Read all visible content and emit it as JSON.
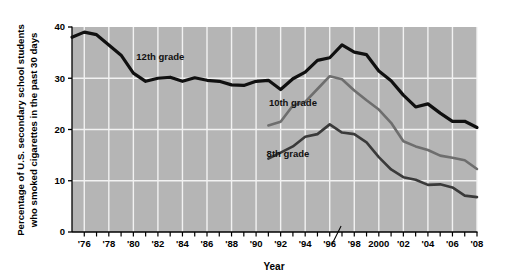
{
  "chart_data": {
    "type": "line",
    "title": "",
    "xlabel": "Year",
    "ylabel": "Percentage of U.S. secondary school students who smoked cigarettes in the past 30 days",
    "ylabel_line1": "Percentage of U.S. secondary school students",
    "ylabel_line2": "who smoked cigarettes in the past 30 days",
    "xlim": [
      1975,
      2008
    ],
    "ylim": [
      0,
      40
    ],
    "y_ticks": [
      0,
      10,
      20,
      30,
      40
    ],
    "y_tick_labels": [
      "0",
      "10",
      "20",
      "30",
      "40"
    ],
    "x_ticks": [
      1976,
      1977,
      1978,
      1979,
      1980,
      1981,
      1982,
      1983,
      1984,
      1985,
      1986,
      1987,
      1988,
      1989,
      1990,
      1991,
      1992,
      1993,
      1994,
      1995,
      1996,
      1997,
      1998,
      1999,
      2000,
      2001,
      2002,
      2003,
      2004,
      2005,
      2006,
      2007,
      2008
    ],
    "x_tick_labels": [
      "'76",
      "'78",
      "'80",
      "'82",
      "'84",
      "'86",
      "'88",
      "'90",
      "'92",
      "'94",
      "'96",
      "'98",
      "2000",
      "'02",
      "'04",
      "'06",
      "'08"
    ],
    "x_tick_label_years": [
      1976,
      1978,
      1980,
      1982,
      1984,
      1986,
      1988,
      1990,
      1992,
      1994,
      1996,
      1998,
      2000,
      2002,
      2004,
      2006,
      2008
    ],
    "grid": "white gridlines on gray plot background",
    "grid_x_years": [
      1976,
      1978,
      1980,
      1982,
      1984,
      1986,
      1988,
      1990,
      1992,
      1994,
      1996,
      1998,
      2000,
      2002,
      2004,
      2006,
      2008
    ],
    "grid_y_values": [
      10,
      20,
      30
    ],
    "legend_position": "inline annotations on plot",
    "plot_background_color": "#b5b5b5",
    "gridline_color": "#f2f2f2",
    "series": [
      {
        "name": "12th grade",
        "label": "12th grade",
        "color": "#101010",
        "x": [
          1975,
          1976,
          1977,
          1978,
          1979,
          1980,
          1981,
          1982,
          1983,
          1984,
          1985,
          1986,
          1987,
          1988,
          1989,
          1990,
          1991,
          1992,
          1993,
          1994,
          1995,
          1996,
          1997,
          1998,
          1999,
          2000,
          2001,
          2002,
          2003,
          2004,
          2005,
          2006,
          2007,
          2008
        ],
        "values": [
          38.0,
          39.0,
          38.5,
          36.5,
          34.5,
          31.0,
          29.4,
          30.0,
          30.2,
          29.4,
          30.1,
          29.6,
          29.4,
          28.7,
          28.6,
          29.4,
          29.6,
          27.8,
          29.9,
          31.2,
          33.5,
          34.0,
          36.5,
          35.1,
          34.6,
          31.4,
          29.5,
          26.7,
          24.4,
          25.0,
          23.2,
          21.6,
          21.6,
          20.4
        ],
        "peak_value": 37,
        "peak_year": 1997,
        "start_value": 38,
        "end_value": 21
      },
      {
        "name": "10th grade",
        "label": "10th grade",
        "color": "#6e6e6e",
        "x": [
          1991,
          1992,
          1993,
          1994,
          1995,
          1996,
          1997,
          1998,
          1999,
          2000,
          2001,
          2002,
          2003,
          2004,
          2005,
          2006,
          2007,
          2008
        ],
        "values": [
          20.8,
          21.5,
          24.7,
          25.4,
          27.9,
          30.4,
          29.8,
          27.6,
          25.7,
          23.9,
          21.3,
          17.7,
          16.7,
          16.0,
          14.9,
          14.5,
          14.0,
          12.3
        ],
        "peak_value": 30,
        "peak_year": 1996,
        "start_value": 21,
        "end_value": 13
      },
      {
        "name": "8th grade",
        "label": "8th grade",
        "color": "#3a3a3a",
        "x": [
          1991,
          1992,
          1993,
          1994,
          1995,
          1996,
          1997,
          1998,
          1999,
          2000,
          2001,
          2002,
          2003,
          2004,
          2005,
          2006,
          2007,
          2008
        ],
        "values": [
          14.3,
          15.5,
          16.7,
          18.6,
          19.1,
          21.0,
          19.4,
          19.1,
          17.5,
          14.6,
          12.2,
          10.7,
          10.2,
          9.2,
          9.3,
          8.7,
          7.1,
          6.8
        ],
        "peak_value": 21,
        "peak_year": 1996,
        "start_value": 15,
        "end_value": 7
      }
    ],
    "annotations": [
      {
        "text": "12th grade",
        "x_year": 1982.2,
        "y_value": 33.6
      },
      {
        "text": "10th grade",
        "x_year": 1993.0,
        "y_value": 24.6
      },
      {
        "text": "8th grade",
        "x_year": 1992.6,
        "y_value": 14.6
      }
    ],
    "pointer_mark": {
      "x_year": 1996.6,
      "description": "small diagonal pointer line at x-axis near 1996"
    }
  }
}
